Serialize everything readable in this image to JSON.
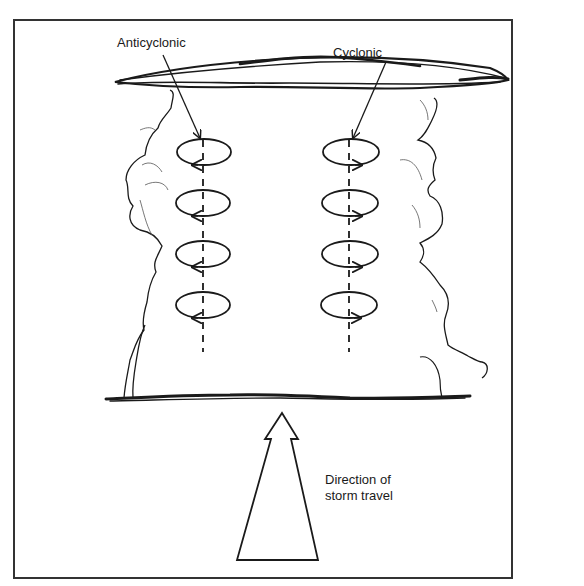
{
  "diagram": {
    "labels": {
      "anticyclonic": "Anticyclonic",
      "cyclonic": "Cyclonic",
      "direction_line1": "Direction of",
      "direction_line2": "storm travel"
    },
    "vortex_columns": [
      {
        "name": "anticyclonic",
        "x": 203,
        "rotation": "clockwise",
        "rings_y": [
          151,
          203,
          254,
          305
        ]
      },
      {
        "name": "cyclonic",
        "x": 349,
        "rotation": "counterclockwise",
        "rings_y": [
          151,
          203,
          254,
          305
        ]
      }
    ],
    "colors": {
      "ink": "#1a1a1a",
      "background": "#ffffff"
    }
  }
}
